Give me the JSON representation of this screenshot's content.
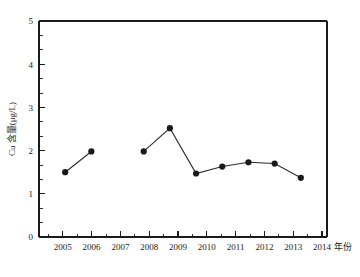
{
  "chart_data": {
    "type": "line",
    "title": "",
    "subtitle": "",
    "xlabel": "年份",
    "ylabel": "Cu 含量(μg/L)",
    "categories": [
      "2005",
      "2006",
      "2007",
      "2008",
      "2009",
      "2010",
      "2011",
      "2012",
      "2013",
      "2014"
    ],
    "x": [
      2005,
      2006,
      2007,
      2008,
      2009,
      2010,
      2011,
      2012,
      2013,
      2014
    ],
    "values": [
      1.5,
      1.98,
      null,
      1.98,
      2.52,
      1.47,
      1.63,
      1.73,
      1.7,
      1.37
    ],
    "series": [
      {
        "name": "Cu 含量",
        "values": [
          1.5,
          1.98,
          null,
          1.98,
          2.52,
          1.47,
          1.63,
          1.73,
          1.7,
          1.37
        ],
        "marker": "filled-circle",
        "color": "#1a1a1a"
      }
    ],
    "ylim": [
      0,
      5
    ],
    "yticks": [
      0,
      1,
      2,
      3,
      4,
      5
    ],
    "ytick_labels": [
      "0",
      "1",
      "2",
      "3",
      "4",
      "5"
    ],
    "y_minor_per_interval": 2,
    "xlim": [
      2004.5,
      2014.5
    ],
    "xticks": [
      2005,
      2006,
      2007,
      2008,
      2009,
      2010,
      2011,
      2012,
      2013,
      2014
    ],
    "xtick_labels": [
      "2005",
      "2006",
      "2007",
      "2008",
      "2009",
      "2010",
      "2011",
      "2012",
      "2013",
      "2014"
    ],
    "x_minor_per_interval": 2,
    "grid": false,
    "legend": false,
    "legend_position": "none",
    "annotations": [],
    "missing_points": [
      "2007"
    ],
    "colors": {
      "line": "#2b2b2b",
      "marker": "#1a1a1a",
      "axis": "#1a1a1a",
      "background": "#ffffff"
    }
  },
  "axes": {
    "y_axis_label": "Cu 含量(μg/L)",
    "x_axis_label": "年份",
    "y_tick_labels": [
      "0",
      "1",
      "2",
      "3",
      "4",
      "5"
    ],
    "x_tick_labels": [
      "2005",
      "2006",
      "2007",
      "2008",
      "2009",
      "2010",
      "2011",
      "2012",
      "2013",
      "2014"
    ]
  }
}
